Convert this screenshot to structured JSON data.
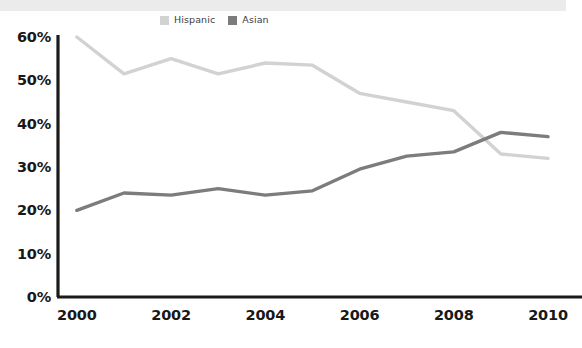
{
  "chart_data": {
    "type": "line",
    "title": "",
    "subtitle": "",
    "xlabel": "",
    "ylabel": "",
    "x": [
      2000,
      2001,
      2002,
      2003,
      2004,
      2005,
      2006,
      2007,
      2008,
      2009,
      2010
    ],
    "xlim": [
      1999.6,
      2010.2
    ],
    "ylim": [
      0,
      60
    ],
    "xticks": [
      "2000",
      "2002",
      "2004",
      "2006",
      "2008",
      "2010"
    ],
    "xtick_values": [
      2000,
      2002,
      2004,
      2006,
      2008,
      2010
    ],
    "yticks": [
      "0%",
      "10%",
      "20%",
      "30%",
      "40%",
      "50%",
      "60%"
    ],
    "ytick_values": [
      0,
      10,
      20,
      30,
      40,
      50,
      60
    ],
    "grid": false,
    "legend_position": "top-center",
    "series": [
      {
        "name": "Hispanic",
        "color": "#d2d2d2",
        "values": [
          60.0,
          51.5,
          55.0,
          51.5,
          54.0,
          53.5,
          47.0,
          45.0,
          43.0,
          33.0,
          32.0
        ]
      },
      {
        "name": "Asian",
        "color": "#7c7c7c",
        "values": [
          20.0,
          24.0,
          23.5,
          25.0,
          23.5,
          24.5,
          29.5,
          32.5,
          33.5,
          38.0,
          37.0
        ]
      }
    ]
  },
  "legend": {
    "items": [
      {
        "label": "Hispanic",
        "swatch_color": "#d2d2d2"
      },
      {
        "label": "Asian",
        "swatch_color": "#7c7c7c"
      }
    ]
  },
  "axes": {
    "axis_color": "#1a1a1a",
    "y_labels": [
      "60%",
      "50%",
      "40%",
      "30%",
      "20%",
      "10%",
      "0%"
    ],
    "x_labels": [
      "2000",
      "2002",
      "2004",
      "2006",
      "2008",
      "2010"
    ]
  },
  "colors": {
    "background": "#ffffff",
    "banner": "#ebebeb",
    "text": "#181818",
    "hispanic": "#d2d2d2",
    "asian": "#7c7c7c"
  }
}
